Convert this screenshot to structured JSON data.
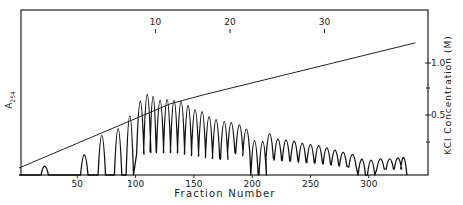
{
  "chart_data": {
    "type": "line",
    "title": "",
    "xlabel": "Fraction Number",
    "ylabel_left": "A254",
    "ylabel_left_main": "A",
    "ylabel_left_sub": "254",
    "ylabel_right": "KCl Concentration (M)",
    "xlim": [
      0,
      350
    ],
    "x_ticks": [
      50,
      100,
      150,
      200,
      250,
      300
    ],
    "x_tick_labels": [
      "50",
      "100",
      "150",
      "200",
      "250",
      "300"
    ],
    "top_ticks": [
      10,
      20,
      30
    ],
    "top_tick_labels": [
      "10",
      "20",
      "30"
    ],
    "top_tick_fraction_positions": [
      117,
      181,
      262
    ],
    "right_ylim": [
      0,
      1.2
    ],
    "right_ticks": [
      0.5,
      1.0
    ],
    "right_tick_labels": [
      "0.5",
      "1.0"
    ],
    "grid": false,
    "series": [
      {
        "name": "A254 absorbance (elution profile)",
        "style": "peaks",
        "peaks": [
          {
            "fraction": 22,
            "height": 0.07
          },
          {
            "fraction": 56,
            "height": 0.2
          },
          {
            "fraction": 71,
            "height": 0.43
          },
          {
            "fraction": 85,
            "height": 0.51
          },
          {
            "fraction": 95,
            "height": 0.66
          },
          {
            "fraction": 104,
            "height": 0.71
          },
          {
            "fraction": 110,
            "height": 0.78
          },
          {
            "fraction": 115,
            "height": 0.75
          },
          {
            "fraction": 121,
            "height": 0.71
          },
          {
            "fraction": 127,
            "height": 0.72
          },
          {
            "fraction": 133,
            "height": 0.71
          },
          {
            "fraction": 139,
            "height": 0.7
          },
          {
            "fraction": 145,
            "height": 0.66
          },
          {
            "fraction": 151,
            "height": 0.62
          },
          {
            "fraction": 157,
            "height": 0.6
          },
          {
            "fraction": 163,
            "height": 0.55
          },
          {
            "fraction": 169,
            "height": 0.52
          },
          {
            "fraction": 176,
            "height": 0.5
          },
          {
            "fraction": 182,
            "height": 0.45
          },
          {
            "fraction": 189,
            "height": 0.43
          },
          {
            "fraction": 195,
            "height": 0.39
          },
          {
            "fraction": 202,
            "height": 0.37
          },
          {
            "fraction": 209,
            "height": 0.36
          },
          {
            "fraction": 215,
            "height": 0.35
          },
          {
            "fraction": 222,
            "height": 0.3
          },
          {
            "fraction": 229,
            "height": 0.29
          },
          {
            "fraction": 236,
            "height": 0.28
          },
          {
            "fraction": 243,
            "height": 0.26
          },
          {
            "fraction": 250,
            "height": 0.25
          },
          {
            "fraction": 257,
            "height": 0.24
          },
          {
            "fraction": 264,
            "height": 0.22
          },
          {
            "fraction": 271,
            "height": 0.2
          },
          {
            "fraction": 278,
            "height": 0.18
          },
          {
            "fraction": 286,
            "height": 0.16
          },
          {
            "fraction": 294,
            "height": 0.15
          },
          {
            "fraction": 302,
            "height": 0.14
          },
          {
            "fraction": 310,
            "height": 0.12
          },
          {
            "fraction": 318,
            "height": 0.12
          },
          {
            "fraction": 325,
            "height": 0.13
          },
          {
            "fraction": 330,
            "height": 0.15
          }
        ]
      },
      {
        "name": "KCl gradient",
        "style": "line",
        "points": [
          {
            "fraction": 0,
            "conc": 0.05
          },
          {
            "fraction": 130,
            "conc": 0.6
          },
          {
            "fraction": 160,
            "conc": 0.68
          },
          {
            "fraction": 340,
            "conc": 1.12
          }
        ]
      }
    ]
  },
  "labels": {
    "xlabel": "Fraction Number",
    "ylabel_left_main": "A",
    "ylabel_left_sub": "254",
    "ylabel_right": "KCl  Concentration (M)"
  }
}
